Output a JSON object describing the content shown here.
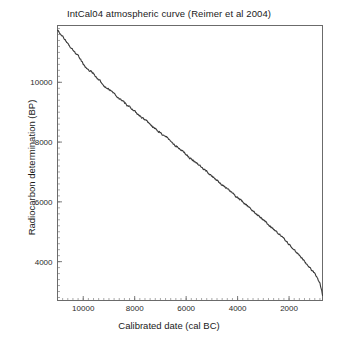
{
  "chart_data": {
    "type": "line",
    "title": "IntCal04 atmospheric curve (Reimer et al 2004)",
    "xlabel": "Calibrated date (cal BC)",
    "ylabel": "Radiocarbon determination (BP)",
    "xlim": [
      11000,
      700
    ],
    "ylim": [
      2700,
      11900
    ],
    "x_reversed": true,
    "grid": false,
    "legend": null,
    "xticks": [
      10000,
      8000,
      6000,
      4000,
      2000
    ],
    "xtick_labels": [
      "10000",
      "8000",
      "6000",
      "4000",
      "2000"
    ],
    "x_minor_tick_step": 200,
    "yticks": [
      4000,
      6000,
      8000,
      10000
    ],
    "ytick_labels": [
      "4000",
      "6000",
      "8000",
      "10000"
    ],
    "y_minor_tick_step": 200,
    "line_color": "#3a3a3a",
    "line_width": 1.1,
    "series": [
      {
        "name": "IntCal04",
        "x": [
          11000,
          10900,
          10800,
          10700,
          10600,
          10500,
          10400,
          10300,
          10200,
          10100,
          10000,
          9900,
          9800,
          9700,
          9600,
          9500,
          9400,
          9300,
          9200,
          9100,
          9000,
          8900,
          8800,
          8700,
          8600,
          8500,
          8400,
          8300,
          8200,
          8100,
          8000,
          7900,
          7800,
          7700,
          7600,
          7500,
          7400,
          7300,
          7200,
          7100,
          7000,
          6900,
          6800,
          6700,
          6600,
          6500,
          6400,
          6300,
          6200,
          6100,
          6000,
          5900,
          5800,
          5700,
          5600,
          5500,
          5400,
          5300,
          5200,
          5100,
          5000,
          4900,
          4800,
          4700,
          4600,
          4500,
          4400,
          4300,
          4200,
          4100,
          4000,
          3900,
          3800,
          3700,
          3600,
          3500,
          3400,
          3300,
          3200,
          3100,
          3000,
          2900,
          2800,
          2700,
          2600,
          2500,
          2400,
          2300,
          2200,
          2100,
          2000,
          1900,
          1800,
          1700,
          1600,
          1500,
          1400,
          1300,
          1200,
          1100,
          1000,
          900,
          800,
          700
        ],
        "y": [
          11750,
          11640,
          11520,
          11410,
          11300,
          11190,
          11060,
          10960,
          10880,
          10760,
          10610,
          10490,
          10420,
          10370,
          10290,
          10180,
          10080,
          10010,
          9900,
          9810,
          9760,
          9720,
          9640,
          9540,
          9470,
          9410,
          9310,
          9240,
          9190,
          9120,
          9030,
          8940,
          8880,
          8810,
          8740,
          8680,
          8600,
          8520,
          8450,
          8380,
          8310,
          8230,
          8170,
          8120,
          8030,
          7940,
          7870,
          7810,
          7740,
          7660,
          7580,
          7510,
          7440,
          7370,
          7300,
          7230,
          7150,
          7080,
          7010,
          6940,
          6860,
          6790,
          6720,
          6650,
          6570,
          6500,
          6430,
          6360,
          6290,
          6220,
          6150,
          6080,
          6010,
          5930,
          5860,
          5780,
          5700,
          5620,
          5550,
          5470,
          5390,
          5320,
          5240,
          5160,
          5080,
          5000,
          4930,
          4850,
          4760,
          4670,
          4580,
          4490,
          4400,
          4310,
          4210,
          4110,
          4010,
          3910,
          3810,
          3700,
          3580,
          3440,
          3280,
          2870
        ]
      }
    ]
  },
  "axes": {
    "frame_color": "#6b6b6b"
  }
}
